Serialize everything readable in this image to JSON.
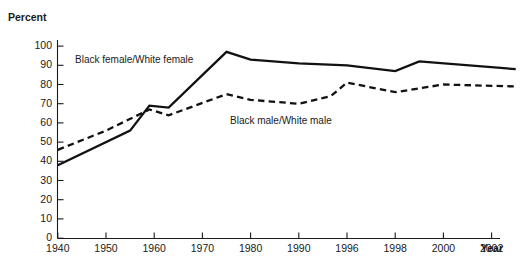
{
  "chart_data": {
    "type": "line",
    "title": "",
    "ylabel": "Percent",
    "xlabel": "Year",
    "ylim": [
      0,
      100
    ],
    "yticks": [
      0,
      10,
      20,
      30,
      40,
      50,
      60,
      70,
      80,
      90,
      100
    ],
    "ytick_labels": [
      "0",
      "10",
      "20",
      "30",
      "40",
      "50",
      "60",
      "70",
      "80",
      "90",
      "100"
    ],
    "grid": false,
    "legend_position": "inline-annotations",
    "x_axis_note": "non-uniform year ticks drawn at equal pixel spacing",
    "categories": [
      "1940",
      "1950",
      "1960",
      "1970",
      "1980",
      "1990",
      "1996",
      "1998",
      "2000",
      "2002"
    ],
    "x": [
      1940,
      1950,
      1960,
      1970,
      1980,
      1990,
      1996,
      1998,
      2000,
      2002
    ],
    "series": [
      {
        "name": "Black female/White female",
        "style": "solid",
        "color": "#111111",
        "points": [
          {
            "x": 1940,
            "y": 38
          },
          {
            "x": 1955,
            "y": 56
          },
          {
            "x": 1959,
            "y": 69
          },
          {
            "x": 1963,
            "y": 68
          },
          {
            "x": 1975,
            "y": 97
          },
          {
            "x": 1980,
            "y": 93
          },
          {
            "x": 1990,
            "y": 91
          },
          {
            "x": 1996,
            "y": 90
          },
          {
            "x": 1998,
            "y": 87
          },
          {
            "x": 1999,
            "y": 92
          },
          {
            "x": 2003,
            "y": 88
          }
        ]
      },
      {
        "name": "Black male/White male",
        "style": "dashed",
        "color": "#111111",
        "points": [
          {
            "x": 1940,
            "y": 46
          },
          {
            "x": 1950,
            "y": 56
          },
          {
            "x": 1959,
            "y": 67
          },
          {
            "x": 1963,
            "y": 64
          },
          {
            "x": 1975,
            "y": 75
          },
          {
            "x": 1980,
            "y": 72
          },
          {
            "x": 1990,
            "y": 70
          },
          {
            "x": 1994,
            "y": 74
          },
          {
            "x": 1996,
            "y": 81
          },
          {
            "x": 1998,
            "y": 76
          },
          {
            "x": 2000,
            "y": 80
          },
          {
            "x": 2003,
            "y": 79
          }
        ]
      }
    ],
    "annotations": [
      {
        "text": "Black female/White female",
        "x_px": 75,
        "y_px": 63
      },
      {
        "text": "Black male/White male",
        "x_px": 230,
        "y_px": 124
      }
    ]
  }
}
